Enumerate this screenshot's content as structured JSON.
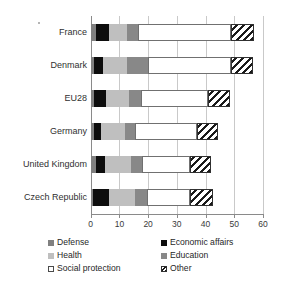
{
  "chart_data": {
    "type": "bar",
    "orientation": "horizontal",
    "stacked": true,
    "title": "",
    "xlabel": "",
    "ylabel": "",
    "xlim": [
      0,
      60
    ],
    "xticks": [
      0,
      10,
      20,
      30,
      40,
      50,
      60
    ],
    "xtick_labels": [
      "0",
      "10",
      "20",
      "30",
      "40",
      "50",
      "60"
    ],
    "grid": true,
    "grid_axis": "x",
    "legend_position": "bottom",
    "categories": [
      "France",
      "Denmark",
      "EU28",
      "Germany",
      "United Kingdom",
      "Czech Republic"
    ],
    "series": [
      {
        "name": "Defense",
        "color": "#808080",
        "values": [
          1.7,
          1.2,
          1.3,
          1.1,
          2.0,
          0.9
        ]
      },
      {
        "name": "Economic affairs",
        "color": "#0d0d0d",
        "values": [
          4.6,
          3.1,
          3.9,
          2.6,
          3.0,
          5.6
        ]
      },
      {
        "name": "Health",
        "color": "#bfbfbf",
        "values": [
          6.3,
          8.2,
          8.1,
          8.3,
          9.0,
          9.0
        ]
      },
      {
        "name": "Education",
        "color": "#888888",
        "values": [
          4.0,
          7.5,
          4.2,
          3.6,
          3.8,
          4.0
        ]
      },
      {
        "name": "Social protection",
        "color": "#ffffff",
        "values": [
          32.4,
          29.0,
          23.5,
          21.4,
          16.7,
          15.0
        ]
      },
      {
        "name": "Other",
        "color": "hatched",
        "values": [
          8.0,
          7.5,
          7.5,
          7.5,
          7.5,
          8.0
        ]
      }
    ],
    "totals": [
      57.0,
      56.5,
      48.5,
      44.5,
      42.0,
      42.5
    ]
  },
  "legend": {
    "left_column": [
      {
        "label": "Defense",
        "swatch": "defense-swatch"
      },
      {
        "label": "Health",
        "swatch": "health-swatch"
      },
      {
        "label": "Social protection",
        "swatch": "social-protection-swatch"
      }
    ],
    "right_column": [
      {
        "label": "Economic affairs",
        "swatch": "economic-affairs-swatch"
      },
      {
        "label": "Education",
        "swatch": "education-swatch"
      },
      {
        "label": "Other",
        "swatch": "other-swatch"
      }
    ]
  },
  "colors": {
    "defense": "#808080",
    "economic_affairs": "#0d0d0d",
    "health": "#bfbfbf",
    "education": "#888888",
    "social_protection": "#ffffff",
    "other_hatch": "#1a1a1a",
    "gridline": "#c9c9c9",
    "axis": "#8a8a8a",
    "text": "#303030"
  }
}
